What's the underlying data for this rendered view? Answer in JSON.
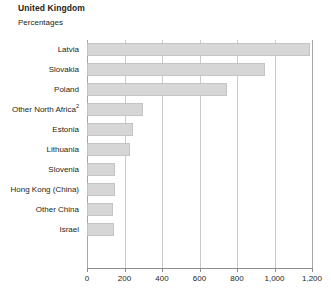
{
  "chart_data": {
    "type": "bar",
    "orientation": "horizontal",
    "title": "United Kingdom",
    "subtitle": "Percentages",
    "xlabel": "",
    "ylabel": "",
    "xlim": [
      0,
      1200
    ],
    "grid": true,
    "legend": false,
    "xticks": [
      0,
      200,
      400,
      600,
      800,
      1000,
      1200
    ],
    "xtick_labels": [
      "0",
      "200",
      "400",
      "600",
      "800",
      "1,000",
      "1,200"
    ],
    "categories": [
      "Latvia",
      "Slovakia",
      "Poland",
      "Other North Africa",
      "Estonia",
      "Lithuania",
      "Slovenia",
      "Hong Kong (China)",
      "Other China",
      "Israel"
    ],
    "category_labels": [
      "Latvia",
      "Slovakia",
      "Poland",
      "Other North Africa²",
      "Estonia",
      "Lithuania",
      "Slovenia",
      "Hong Kong (China)",
      "Other China",
      "Israel"
    ],
    "category_footnotes": [
      "",
      "",
      "",
      "2",
      "",
      "",
      "",
      "",
      "",
      ""
    ],
    "values": [
      1190,
      950,
      745,
      300,
      245,
      230,
      150,
      150,
      140,
      145
    ],
    "bar_color": "#d6d6d6",
    "bar_border_color": "#c4c4c4",
    "gridline_color": "#c9c9c9",
    "axis_color": "#8c8c8c",
    "text_color": "#231f20"
  }
}
